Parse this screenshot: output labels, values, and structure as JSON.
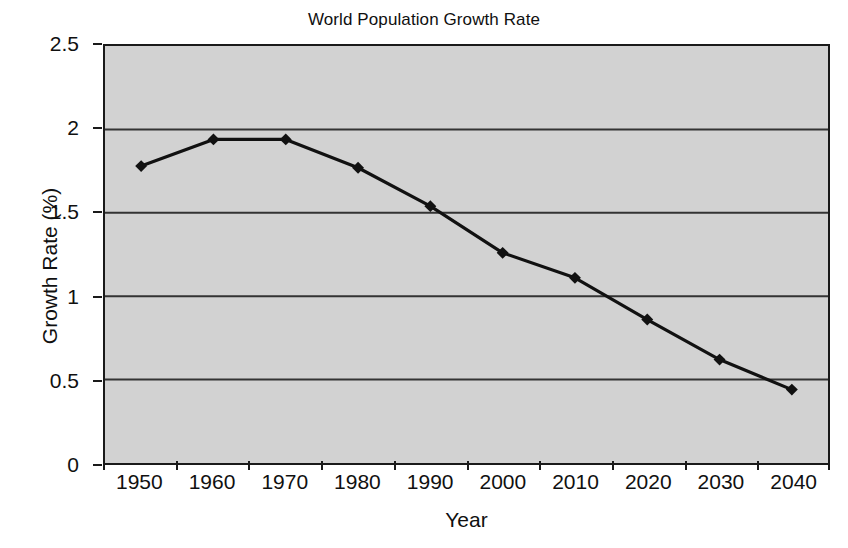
{
  "chart_data": {
    "type": "line",
    "title": "World Population Growth Rate",
    "xlabel": "Year",
    "ylabel": "Growth Rate (%)",
    "categories": [
      "1950",
      "1960",
      "1970",
      "1980",
      "1990",
      "2000",
      "2010",
      "2020",
      "2030",
      "2040"
    ],
    "x": [
      1950,
      1960,
      1970,
      1980,
      1990,
      2000,
      2010,
      2020,
      2030,
      2040
    ],
    "values": [
      1.78,
      1.94,
      1.94,
      1.77,
      1.54,
      1.26,
      1.11,
      0.86,
      0.62,
      0.44
    ],
    "series": [
      {
        "name": "Growth Rate (%)",
        "values": [
          1.78,
          1.94,
          1.94,
          1.77,
          1.54,
          1.26,
          1.11,
          0.86,
          0.62,
          0.44
        ]
      }
    ],
    "ylim": [
      0,
      2.5
    ],
    "ytick_values": [
      0,
      0.5,
      1,
      1.5,
      2,
      2.5
    ],
    "ytick_labels": [
      "0",
      "0.5",
      "1",
      "1.5",
      "2",
      "2.5"
    ],
    "xtick_labels": [
      "1950",
      "1960",
      "1970",
      "1980",
      "1990",
      "2000",
      "2010",
      "2020",
      "2030",
      "2040"
    ],
    "grid": "horizontal",
    "legend": "none",
    "marker": "diamond",
    "colors": {
      "line": "#111111",
      "marker": "#111111",
      "plot_background": "#d2d2d2",
      "grid": "#333333",
      "axis": "#1a1a1a",
      "text": "#101010",
      "figure_background": "#ffffff"
    }
  }
}
